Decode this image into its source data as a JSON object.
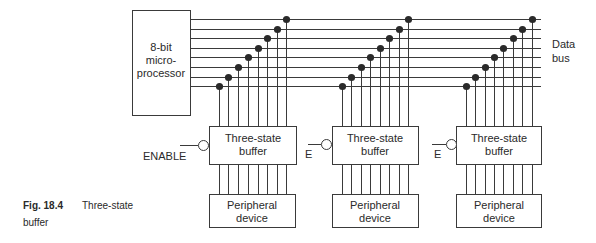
{
  "figure": {
    "caption_number": "Fig. 18.4",
    "caption_title_line1": "Three-state",
    "caption_title_line2": "buffer"
  },
  "microprocessor": {
    "line1": "8-bit",
    "line2": "micro-",
    "line3": "processor"
  },
  "data_bus": {
    "label_line1": "Data",
    "label_line2": "bus",
    "line_count": 8
  },
  "units": [
    {
      "enable_label": "ENABLE",
      "buffer_line1": "Three-state",
      "buffer_line2": "buffer",
      "device_line1": "Peripheral",
      "device_line2": "device"
    },
    {
      "enable_label": "E",
      "buffer_line1": "Three-state",
      "buffer_line2": "buffer",
      "device_line1": "Peripheral",
      "device_line2": "device"
    },
    {
      "enable_label": "E",
      "buffer_line1": "Three-state",
      "buffer_line2": "buffer",
      "device_line1": "Peripheral",
      "device_line2": "device"
    }
  ],
  "colors": {
    "line": "#3a3a3a",
    "dot": "#2a2a2a",
    "background": "#ffffff"
  }
}
